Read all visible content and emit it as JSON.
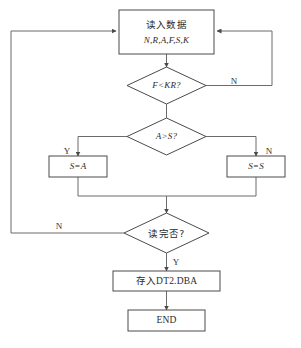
{
  "diagram": {
    "type": "program-flowchart",
    "language": "zh-CN",
    "colors": {
      "background": "#ffffff",
      "node_stroke": "#4a4a4a",
      "connector_stroke": "#6b6b6b",
      "text": "#2b2b2b"
    },
    "nodes": [
      {
        "id": "read-data",
        "shape": "rectangle",
        "line1": "读入数据",
        "line2": "N,R,A,F,S,K"
      },
      {
        "id": "f-lt-kr",
        "shape": "diamond",
        "label": "F<KR?"
      },
      {
        "id": "a-gt-s",
        "shape": "diamond",
        "label": "A>S?"
      },
      {
        "id": "s-eq-a",
        "shape": "rectangle",
        "label": "S=A"
      },
      {
        "id": "s-eq-s",
        "shape": "rectangle",
        "label": "S=S"
      },
      {
        "id": "read-done",
        "shape": "diamond",
        "label": "读完否?"
      },
      {
        "id": "save-file",
        "shape": "rectangle",
        "label": "存入DT2.DBA"
      },
      {
        "id": "end",
        "shape": "rectangle",
        "label": "END"
      }
    ],
    "branch_labels": {
      "f_lt_kr_no": "N",
      "a_gt_s_yes": "Y",
      "a_gt_s_no": "N",
      "read_done_no": "N",
      "read_done_yes": "Y"
    }
  }
}
